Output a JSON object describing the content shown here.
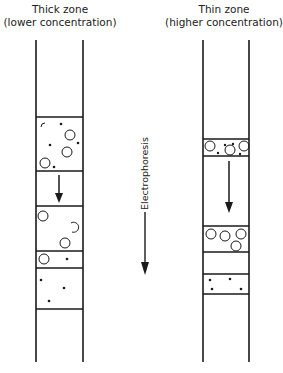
{
  "diagram": {
    "left_panel": {
      "title_line1": "Thick zone",
      "title_line2": "(lower concentration)"
    },
    "right_panel": {
      "title_line1": "Thin zone",
      "title_line2": "(higher concentration)"
    },
    "center_label": "Electrophoresis",
    "colors": {
      "line": "#1a1a1a",
      "background": "#ffffff"
    }
  }
}
